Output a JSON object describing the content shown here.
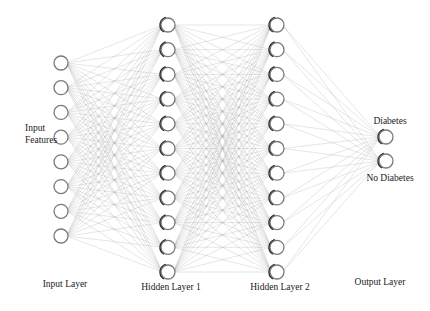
{
  "diagram": {
    "type": "neural-network",
    "layers": [
      {
        "id": "input",
        "label": "Input Layer",
        "nodes": 8,
        "x": 61,
        "y_top": 63,
        "y_bottom": 236,
        "label_x": 65,
        "label_y": 287
      },
      {
        "id": "hidden1",
        "label": "Hidden Layer 1",
        "nodes": 11,
        "x": 168,
        "y_top": 25,
        "y_bottom": 272,
        "label_x": 171,
        "label_y": 290
      },
      {
        "id": "hidden2",
        "label": "Hidden Layer 2",
        "nodes": 11,
        "x": 277,
        "y_top": 25,
        "y_bottom": 272,
        "label_x": 280,
        "label_y": 290
      },
      {
        "id": "output",
        "label": "Output Layer",
        "nodes": 2,
        "x": 386,
        "y_top": 137,
        "y_bottom": 161,
        "label_x": 380,
        "label_y": 285
      }
    ],
    "annotations": {
      "input_features": {
        "line1": "Input",
        "line2": "Features",
        "x": 25,
        "y1": 131,
        "y2": 143
      },
      "outputs": [
        {
          "text": "Diabetes",
          "x": 390,
          "y": 124
        },
        {
          "text": "No Diabetes",
          "x": 390,
          "y": 181
        }
      ]
    },
    "style": {
      "node_radius": 7,
      "edge_color": "#9a9a9a",
      "node_stroke": "#7a7a7a",
      "background": "#ffffff"
    }
  }
}
